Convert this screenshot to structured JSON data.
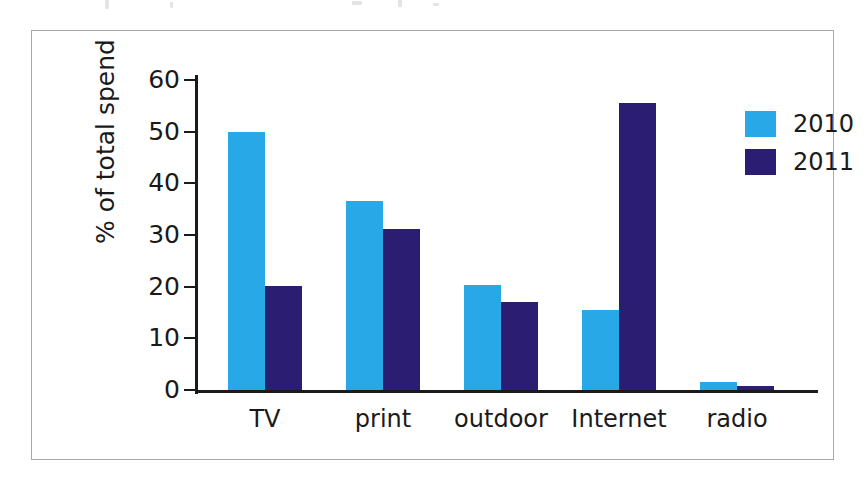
{
  "figure": {
    "frame_border_color": "#a6a8ad",
    "background": "#ffffff"
  },
  "chart_data": {
    "type": "bar",
    "title": "",
    "xlabel": "",
    "ylabel": "% of total spend",
    "ylim": [
      0,
      60
    ],
    "yticks": [
      0,
      10,
      20,
      30,
      40,
      50,
      60
    ],
    "grid": false,
    "legend_position": "top-right",
    "categories": [
      "TV",
      "print",
      "outdoor",
      "Internet",
      "radio"
    ],
    "series": [
      {
        "name": "2010",
        "color": "#29a8e8",
        "values": [
          50.0,
          36.5,
          20.3,
          15.4,
          1.5
        ]
      },
      {
        "name": "2011",
        "color": "#2a1d72",
        "values": [
          20.2,
          31.1,
          17.0,
          55.5,
          0.7
        ]
      }
    ]
  },
  "legend": {
    "entries": [
      {
        "label": "2010",
        "color": "#29a8e8"
      },
      {
        "label": "2011",
        "color": "#2a1d72"
      }
    ]
  }
}
